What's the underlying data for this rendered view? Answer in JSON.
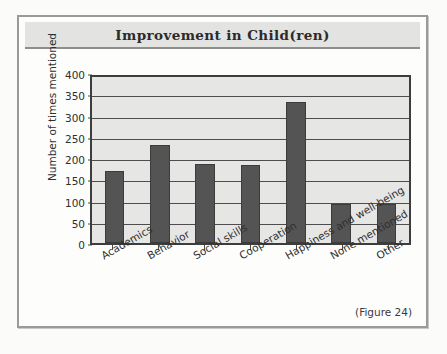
{
  "figure": {
    "caption": "(Figure 24)"
  },
  "chart_data": {
    "type": "bar",
    "title": "Improvement in Child(ren)",
    "xlabel": "",
    "ylabel": "Number of times mentioned",
    "categories": [
      "Academics",
      "Behavior",
      "Social skills",
      "Cooperation",
      "Happiness and well-being",
      "None mentioned",
      "Other"
    ],
    "values": [
      173,
      237,
      190,
      189,
      340,
      95,
      94
    ],
    "ylim": [
      0,
      400
    ],
    "yticks": [
      0,
      50,
      100,
      150,
      200,
      250,
      300,
      350,
      400
    ],
    "ytick_labels": [
      "0",
      "50",
      "100",
      "150",
      "200",
      "250",
      "300",
      "350",
      "400"
    ],
    "grid": true,
    "legend": false,
    "colors": {
      "bar_fill": "#545454",
      "bar_border": "#3c3c3c",
      "plot_background": "#e6e6e4",
      "axis": "#3d3d3d",
      "gridline": "#4d4d4d",
      "title_band": "#e3e3e1",
      "frame_border": "#9a9a99"
    }
  }
}
